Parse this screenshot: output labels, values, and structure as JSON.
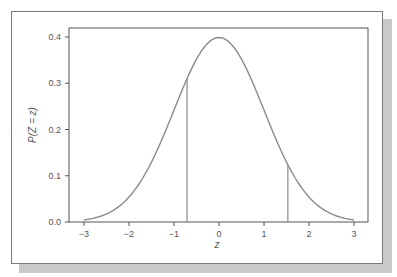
{
  "chart_data": {
    "type": "line",
    "title": "",
    "xlabel": "z",
    "ylabel": "P(Z = z)",
    "xlim": [
      -3.3,
      3.3
    ],
    "ylim": [
      0.0,
      0.42
    ],
    "x_ticks": [
      -3,
      -2,
      -1,
      0,
      1,
      2,
      3
    ],
    "x_tick_labels": [
      "−3",
      "−2",
      "−1",
      "0",
      "1",
      "2",
      "3"
    ],
    "y_ticks": [
      0.0,
      0.1,
      0.2,
      0.3,
      0.4
    ],
    "y_tick_labels": [
      "0.0",
      "0.1",
      "0.2",
      "0.3",
      "0.4"
    ],
    "grid": false,
    "legend": null,
    "series": [
      {
        "name": "standard normal density",
        "x": [
          -3.0,
          -2.5,
          -2.0,
          -1.5,
          -1.0,
          -0.5,
          0.0,
          0.5,
          1.0,
          1.5,
          2.0,
          2.5,
          3.0
        ],
        "values": [
          0.004,
          0.018,
          0.054,
          0.13,
          0.242,
          0.352,
          0.399,
          0.352,
          0.242,
          0.13,
          0.054,
          0.018,
          0.004
        ]
      }
    ],
    "vertical_lines": [
      {
        "x": -0.71,
        "y_top": 0.31
      },
      {
        "x": 1.53,
        "y_top": 0.124
      }
    ],
    "line_color": "#8a8a8a",
    "axis_color": "#555555"
  }
}
